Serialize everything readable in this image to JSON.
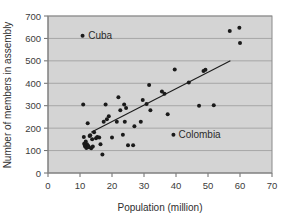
{
  "chart_data": {
    "type": "scatter",
    "title": "",
    "xlabel": "Population (million)",
    "ylabel": "Number of members in assembly",
    "xlim": [
      0,
      70
    ],
    "ylim": [
      0,
      700
    ],
    "xticks": [
      0,
      10,
      20,
      30,
      40,
      50,
      60,
      70
    ],
    "yticks": [
      0,
      100,
      200,
      300,
      400,
      500,
      600,
      700
    ],
    "grid": "horizontal",
    "legend": "none",
    "x": [
      10.8,
      11.0,
      11.2,
      11.3,
      11.5,
      11.6,
      11.8,
      12.0,
      12.2,
      12.4,
      12.6,
      12.8,
      13.0,
      13.2,
      13.5,
      13.8,
      14.0,
      14.4,
      15.0,
      15.4,
      16.0,
      16.4,
      17.0,
      17.4,
      18.0,
      18.4,
      19.0,
      20.0,
      21.5,
      22.0,
      22.6,
      23.4,
      23.8,
      24.0,
      24.4,
      25.0,
      26.6,
      27.0,
      29.0,
      29.6,
      30.8,
      31.6,
      32.0,
      35.6,
      36.4,
      37.4,
      39.2,
      39.6,
      44.0,
      47.2,
      48.6,
      49.2,
      51.8,
      56.8,
      59.8,
      60.0
    ],
    "y": [
      612,
      305,
      160,
      130,
      125,
      118,
      140,
      112,
      128,
      222,
      120,
      115,
      165,
      168,
      110,
      150,
      118,
      182,
      155,
      160,
      158,
      128,
      83,
      228,
      305,
      240,
      253,
      158,
      228,
      338,
      280,
      170,
      305,
      228,
      290,
      124,
      124,
      208,
      228,
      325,
      308,
      392,
      280,
      363,
      353,
      262,
      171,
      462,
      403,
      300,
      455,
      460,
      302,
      633,
      648,
      580
    ],
    "annotations": [
      {
        "label": "Cuba",
        "x": 11.0,
        "y": 612
      },
      {
        "label": "Colombia",
        "x": 39.2,
        "y": 171
      }
    ],
    "trend_line": {
      "x0": 13.5,
      "y0": 182,
      "x1": 57.0,
      "y1": 500
    },
    "colors": {
      "point": "#1a1a1a",
      "plot_background": "#d4d4d4",
      "grid": "#9a9a9a",
      "trend": "#1c1c1c"
    }
  }
}
